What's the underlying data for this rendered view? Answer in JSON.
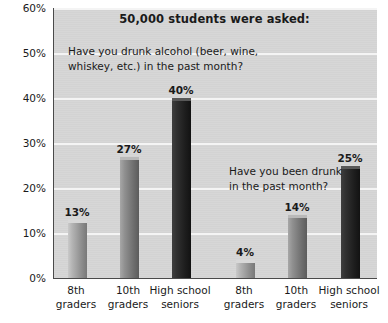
{
  "chart_data": {
    "type": "bar",
    "title": "50,000 students were asked:",
    "xlabel": "",
    "ylabel": "",
    "ylim": [
      0,
      60
    ],
    "ytick_labels": [
      "0%",
      "10%",
      "20%",
      "30%",
      "40%",
      "50%",
      "60%"
    ],
    "ytick_values": [
      0,
      10,
      20,
      30,
      40,
      50,
      60
    ],
    "grid": true,
    "legend": "none",
    "categories": [
      "8th\ngraders",
      "10th\ngraders",
      "High school\nseniors",
      "8th\ngraders",
      "10th\ngraders",
      "High school\nseniors"
    ],
    "values": [
      13,
      27,
      40,
      4,
      14,
      25
    ],
    "value_labels": [
      "13%",
      "27%",
      "40%",
      "4%",
      "14%",
      "25%"
    ],
    "annotations": [
      {
        "id": "question-1",
        "text": "Have you drunk alcohol (beer, wine,\nwhiskey, etc.) in the past month?",
        "applies_to": [
          0,
          1,
          2
        ]
      },
      {
        "id": "question-2",
        "text": "Have you been drunk\nin the past month?",
        "applies_to": [
          3,
          4,
          5
        ]
      }
    ],
    "groups": [
      {
        "label": "Have you drunk alcohol (beer, wine, whiskey, etc.) in the past month?",
        "values": [
          13,
          27,
          40
        ]
      },
      {
        "label": "Have you been drunk in the past month?",
        "values": [
          4,
          14,
          25
        ]
      }
    ],
    "bar_shades": [
      "light",
      "mid",
      "dark",
      "light",
      "mid",
      "dark"
    ],
    "colors": {
      "plot_background": "#d6d6d6",
      "gridline": "#f4f4f4",
      "axis": "#4a4a4a",
      "text": "#1a1a1a",
      "bar_light": "#b4b4b4",
      "bar_mid": "#8f8f8f",
      "bar_dark": "#222222"
    }
  }
}
